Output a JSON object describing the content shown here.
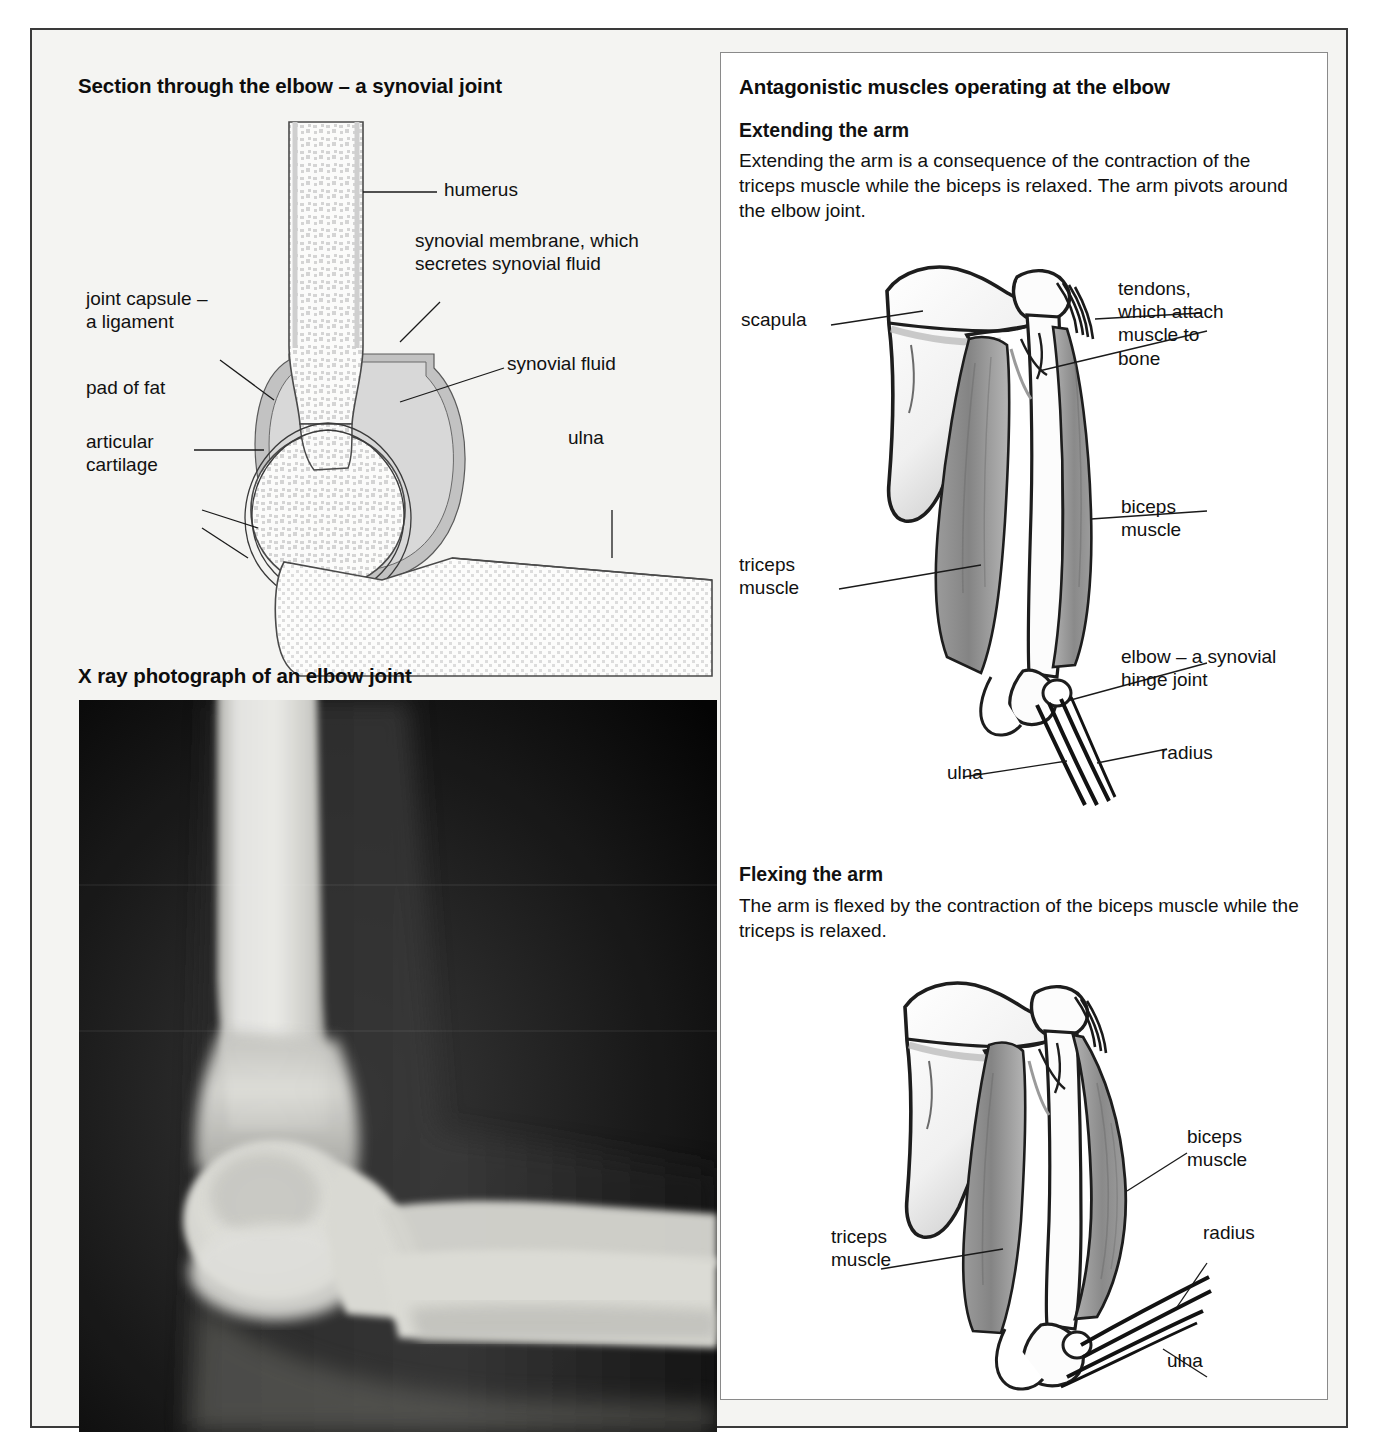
{
  "figure": {
    "left_panel": {
      "section_title": "Section through the elbow – a synovial joint",
      "xray_title": "X ray photograph of an elbow joint",
      "labels": {
        "humerus": "humerus",
        "synovial_membrane": "synovial membrane, which\nsecretes synovial fluid",
        "synovial_fluid": "synovial fluid",
        "joint_capsule": "joint capsule –\na ligament",
        "pad_of_fat": "pad of fat",
        "articular_cartilage": "articular\ncartilage",
        "ulna": "ulna"
      }
    },
    "right_panel": {
      "title": "Antagonistic muscles operating at the elbow",
      "extending": {
        "heading": "Extending the arm",
        "text": "Extending the arm is a consequence of the contraction of the triceps muscle while the biceps is relaxed. The arm pivots around the elbow joint.",
        "labels": {
          "scapula": "scapula",
          "tendons": "tendons,\nwhich attach\nmuscle to\nbone",
          "biceps": "biceps\nmuscle",
          "triceps": "triceps\nmuscle",
          "elbow": "elbow – a synovial\nhinge joint",
          "ulna": "ulna",
          "radius": "radius"
        }
      },
      "flexing": {
        "heading": "Flexing the arm",
        "text": "The arm is flexed by the contraction of the biceps muscle while the triceps is relaxed.",
        "labels": {
          "biceps": "biceps\nmuscle",
          "triceps": "triceps\nmuscle",
          "radius": "radius",
          "ulna": "ulna"
        }
      }
    },
    "colors": {
      "page_background": "#f4f4f2",
      "frame_border": "#3a3a3a",
      "panel_background": "#ffffff",
      "bone_outline": "#3c3c3c",
      "cancellous_bone": "#d9d9d9",
      "joint_capsule": "#bdbdbd",
      "muscle_shade": "#8e8e8e",
      "text": "#111111",
      "xray_background": "#0a0a0a",
      "xray_bone": "#e8e8e4"
    }
  }
}
